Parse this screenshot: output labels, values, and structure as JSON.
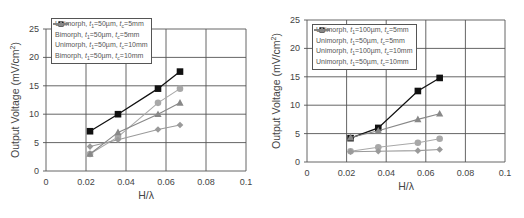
{
  "colors": {
    "grid": "#555555",
    "axis": "#555555",
    "black_series": "#111111",
    "light_gray_series": "#a8a8a8",
    "mid_gray_series": "#888888",
    "diamond_series": "#9a9a9a"
  },
  "chart_data": [
    {
      "type": "line",
      "title": "",
      "xlabel": "H/λ",
      "ylabel": "Output Voltage (mV/cm²)",
      "xlim": [
        0,
        0.1
      ],
      "ylim": [
        0,
        25
      ],
      "xticks": [
        "0",
        "0.02",
        "0.04",
        "0.06",
        "0.08",
        "0.1"
      ],
      "yticks": [
        "0",
        "5",
        "10",
        "15",
        "20",
        "25"
      ],
      "grid": true,
      "legend_position": "upper-left",
      "x": [
        0.022,
        0.036,
        0.056,
        0.067
      ],
      "series": [
        {
          "name": "Unimorph, t1=50µm, tc=5mm",
          "marker": "circle",
          "color": "#a8a8a8",
          "values": [
            3.0,
            6.0,
            12.0,
            14.5
          ]
        },
        {
          "name": "Bimorph, t1=50µm, tc=5mm",
          "marker": "square",
          "color": "#111111",
          "values": [
            7.0,
            10.0,
            14.5,
            17.5
          ]
        },
        {
          "name": "Unimorph, t1=50µm, tc=10mm",
          "marker": "diamond",
          "color": "#9a9a9a",
          "values": [
            4.3,
            5.5,
            7.3,
            8.1
          ]
        },
        {
          "name": "Bimorph, t1=50µm, tc=10mm",
          "marker": "triangle",
          "color": "#888888",
          "values": [
            3.0,
            6.8,
            10.0,
            12.0
          ]
        }
      ]
    },
    {
      "type": "line",
      "title": "",
      "xlabel": "H/λ",
      "ylabel": "Output Voltage (mV/cm²)",
      "xlim": [
        0,
        0.1
      ],
      "ylim": [
        0,
        25
      ],
      "xticks": [
        "0",
        "0.02",
        "0.04",
        "0.06",
        "0.08",
        "0.1"
      ],
      "yticks": [
        "0",
        "5",
        "10",
        "15",
        "20",
        "25"
      ],
      "grid": true,
      "legend_position": "upper-left",
      "x": [
        0.022,
        0.036,
        0.056,
        0.067
      ],
      "series": [
        {
          "name": "Unimorph, t1=100µm, tc=5mm",
          "marker": "circle",
          "color": "#a8a8a8",
          "values": [
            1.9,
            2.6,
            3.4,
            4.1
          ]
        },
        {
          "name": "Unimorph, t1=50µm, tc=5mm",
          "marker": "square",
          "color": "#111111",
          "values": [
            4.2,
            6.0,
            12.5,
            14.8
          ]
        },
        {
          "name": "Unimorph, t1=100µm, tc=10mm",
          "marker": "diamond",
          "color": "#9a9a9a",
          "values": [
            1.8,
            1.9,
            2.0,
            2.2
          ]
        },
        {
          "name": "Unimorph, t1=50µm, tc=10mm",
          "marker": "triangle",
          "color": "#888888",
          "values": [
            4.3,
            5.5,
            7.5,
            8.5
          ]
        }
      ]
    }
  ],
  "left_chart": {
    "ylabel": "Output Voltage (mV/cm",
    "ylabel_sup": "2",
    "ylabel_end": ")",
    "xlabel": "H/λ",
    "legend": [
      {
        "type": "Unimorph, ",
        "t1": "50µm",
        "tc": "5mm"
      },
      {
        "type": "Bimorph, ",
        "t1": "50µm",
        "tc": "5mm"
      },
      {
        "type": "Unimorph, ",
        "t1": "50µm",
        "tc": "10mm"
      },
      {
        "type": "Bimorph, ",
        "t1": "50µm",
        "tc": "10mm"
      }
    ]
  },
  "right_chart": {
    "ylabel": "Output Voltage (mV/cm",
    "ylabel_sup": "2",
    "ylabel_end": ")",
    "xlabel": "H/λ",
    "legend": [
      {
        "type": "Unimorph, ",
        "t1": "100µm",
        "tc": "5mm"
      },
      {
        "type": "Unimorph, ",
        "t1": "50µm",
        "tc": "5mm"
      },
      {
        "type": "Unimorph, ",
        "t1": "100µm",
        "tc": "10mm"
      },
      {
        "type": "Unimorph, ",
        "t1": "50µm",
        "tc": "10mm"
      }
    ]
  },
  "legend_symbols": {
    "t": "t",
    "sub1": "1",
    "subc": "c",
    "eq": "="
  }
}
